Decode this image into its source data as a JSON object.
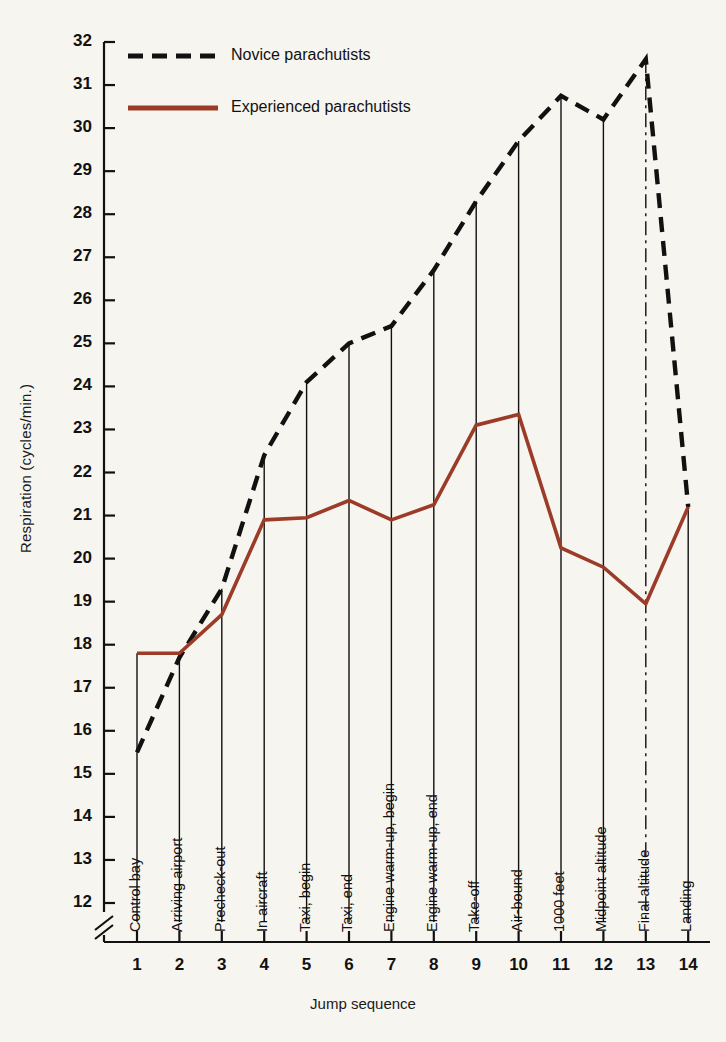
{
  "chart_data": {
    "type": "line",
    "title": "",
    "xlabel": "Jump sequence",
    "ylabel": "Respiration (cycles/min.)",
    "xlim": [
      1,
      14
    ],
    "ylim": [
      12,
      32
    ],
    "ytick_labels": [
      "32",
      "31",
      "30",
      "29",
      "28",
      "27",
      "26",
      "25",
      "24",
      "23",
      "22",
      "21",
      "20",
      "19",
      "18",
      "17",
      "16",
      "15",
      "14",
      "13",
      "12"
    ],
    "ytick_values": [
      32,
      31,
      30,
      29,
      28,
      27,
      26,
      25,
      24,
      23,
      22,
      21,
      20,
      19,
      18,
      17,
      16,
      15,
      14,
      13,
      12
    ],
    "xtick_labels": [
      "1",
      "2",
      "3",
      "4",
      "5",
      "6",
      "7",
      "8",
      "9",
      "10",
      "11",
      "12",
      "13",
      "14"
    ],
    "x": [
      1,
      2,
      3,
      4,
      5,
      6,
      7,
      8,
      9,
      10,
      11,
      12,
      13,
      14
    ],
    "categories": [
      "Control bay",
      "Arriving airport",
      "Precheck-out",
      "In aircraft",
      "Taxi, begin",
      "Taxi, end",
      "Engine warm-up, begin",
      "Engine warm-up, end",
      "Take-off",
      "Air-bound",
      "1000 feet",
      "Midpoint altitude",
      "Final altitude",
      "Landing"
    ],
    "series": [
      {
        "name": "Novice parachutists",
        "style": "dashed",
        "color": "#111111",
        "values": [
          15.5,
          17.7,
          19.3,
          22.4,
          24.1,
          25.0,
          25.4,
          26.7,
          28.3,
          29.7,
          30.75,
          30.2,
          31.6,
          21.2
        ]
      },
      {
        "name": "Experienced parachutists",
        "style": "solid",
        "color": "#9b3b28",
        "values": [
          17.8,
          17.8,
          18.7,
          20.9,
          20.95,
          21.35,
          20.9,
          21.25,
          23.1,
          23.35,
          20.25,
          19.8,
          18.95,
          21.2
        ]
      }
    ],
    "axis_break": true,
    "grid": false,
    "legend_position": "top-left",
    "legend": [
      {
        "label": "Novice parachutists",
        "style": "dashed",
        "color": "#111111"
      },
      {
        "label": "Experienced parachutists",
        "style": "solid",
        "color": "#9b3b28"
      }
    ],
    "colors": {
      "background": "#f7f5ef",
      "axis": "#111111",
      "novice": "#111111",
      "experienced": "#9b3b28"
    }
  }
}
